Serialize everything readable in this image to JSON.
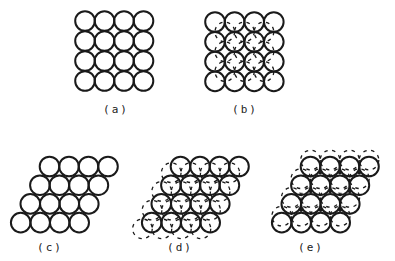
{
  "figure": {
    "stroke_color": "#1a1a1a",
    "background": "#ffffff",
    "radius": 9.8,
    "panels": [
      {
        "id": "a",
        "label": "(a)",
        "label_pos": [
          116,
          110
        ],
        "type": "square",
        "origin": [
          85,
          21
        ],
        "pitch_x": 19.5,
        "pitch_y": 20,
        "rows": 4,
        "cols": 4,
        "overlay": "none"
      },
      {
        "id": "b",
        "label": "(b)",
        "label_pos": [
          245,
          110
        ],
        "type": "square",
        "origin": [
          215,
          22
        ],
        "pitch_x": 19.6,
        "pitch_y": 19.8,
        "rows": 4,
        "cols": 4,
        "overlay": "square-hollow-dashed"
      },
      {
        "id": "c",
        "label": "(c)",
        "label_pos": [
          50,
          248
        ],
        "type": "hex",
        "origin": [
          49.5,
          166.5
        ],
        "pitch_x": 19.5,
        "row_dy": 18.7,
        "row_dx": -9.6,
        "rows": 4,
        "cols": 4,
        "overlay": "none"
      },
      {
        "id": "d",
        "label": "(d)",
        "label_pos": [
          180,
          248
        ],
        "type": "hex",
        "origin": [
          180.5,
          166.5
        ],
        "pitch_x": 19.5,
        "row_dy": 18.7,
        "row_dx": -9.6,
        "rows": 4,
        "cols": 4,
        "overlay": "hex-B-dashed"
      },
      {
        "id": "e",
        "label": "(e)",
        "label_pos": [
          311,
          248
        ],
        "type": "hex",
        "origin": [
          310.5,
          166.5
        ],
        "pitch_x": 19.5,
        "row_dy": 18.7,
        "row_dx": -9.6,
        "rows": 4,
        "cols": 4,
        "overlay": "hex-C-dashed"
      }
    ]
  }
}
